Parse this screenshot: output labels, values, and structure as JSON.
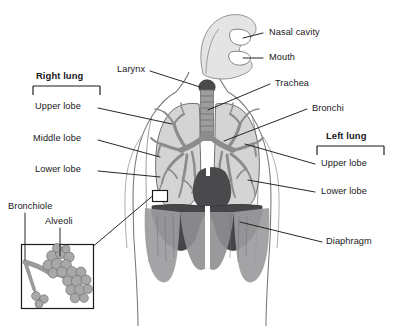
{
  "figure": {
    "background_color": "#ffffff",
    "line_color": "#1b1b1b",
    "palette": {
      "body_outline": "#6e6e72",
      "lung_tissue": "#d2d2d2",
      "bronchial_tree": "#8e8e8e",
      "trachea": "#9a9a9a",
      "larynx_dark": "#4a4a4a",
      "diaphragm_dark": "#3b3b3d",
      "abdomen": "#9b9b9b",
      "airway_light": "#dedede",
      "alveoli_fill": "#a9a9a9"
    }
  },
  "labels": {
    "nasal_cavity": "Nasal cavity",
    "mouth": "Mouth",
    "trachea": "Trachea",
    "bronchi": "Bronchi",
    "larynx": "Larynx",
    "diaphragm": "Diaphragm",
    "bronchiole": "Bronchiole",
    "alveoli": "Alveoli"
  },
  "right_lung": {
    "title": "Right lung",
    "lobes": [
      "Upper lobe",
      "Middle lobe",
      "Lower lobe"
    ]
  },
  "left_lung": {
    "title": "Left lung",
    "lobes": [
      "Upper lobe",
      "Lower lobe"
    ]
  },
  "inset": {
    "name": "alveoli-magnification-inset",
    "callout_labels": [
      "Bronchiole",
      "Alveoli"
    ]
  }
}
